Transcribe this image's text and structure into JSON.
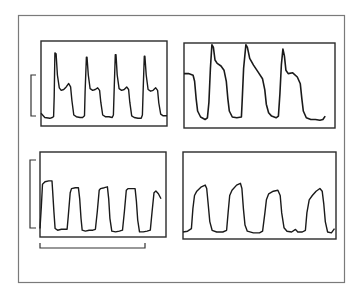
{
  "figure": {
    "colors": {
      "background": "#ffffff",
      "trace": "#1a1a1a",
      "frame": "#6e6e6e",
      "panel_border": "#2a2a2a",
      "scale_bar": "#333333"
    },
    "scale_bars": [
      {
        "id": "amplitude-top-left",
        "orientation": "vertical",
        "attached_to": "panel-1",
        "span_fraction": 0.49
      },
      {
        "id": "amplitude-bottom-left",
        "orientation": "vertical",
        "attached_to": "panel-3",
        "span_fraction": 0.8
      },
      {
        "id": "time-bottom-left",
        "orientation": "horizontal",
        "attached_to": "panel-3",
        "span_fraction": 0.83
      }
    ],
    "panels": [
      {
        "id": "panel-1",
        "position": "top-left",
        "waveform": "sharp-spike-with-secondary-hump",
        "cycles": 4,
        "points": [
          [
            0.0,
            0.15
          ],
          [
            0.03,
            0.1
          ],
          [
            0.07,
            0.09
          ],
          [
            0.09,
            0.1
          ],
          [
            0.1,
            0.11
          ],
          [
            0.105,
            0.35
          ],
          [
            0.11,
            0.86
          ],
          [
            0.12,
            0.85
          ],
          [
            0.13,
            0.6
          ],
          [
            0.145,
            0.45
          ],
          [
            0.16,
            0.42
          ],
          [
            0.18,
            0.43
          ],
          [
            0.2,
            0.46
          ],
          [
            0.22,
            0.5
          ],
          [
            0.235,
            0.46
          ],
          [
            0.245,
            0.3
          ],
          [
            0.26,
            0.13
          ],
          [
            0.28,
            0.11
          ],
          [
            0.31,
            0.1
          ],
          [
            0.33,
            0.1
          ],
          [
            0.345,
            0.12
          ],
          [
            0.35,
            0.4
          ],
          [
            0.36,
            0.81
          ],
          [
            0.365,
            0.81
          ],
          [
            0.375,
            0.6
          ],
          [
            0.39,
            0.44
          ],
          [
            0.41,
            0.42
          ],
          [
            0.43,
            0.43
          ],
          [
            0.45,
            0.45
          ],
          [
            0.465,
            0.42
          ],
          [
            0.475,
            0.28
          ],
          [
            0.49,
            0.13
          ],
          [
            0.51,
            0.11
          ],
          [
            0.54,
            0.11
          ],
          [
            0.565,
            0.1
          ],
          [
            0.575,
            0.13
          ],
          [
            0.58,
            0.4
          ],
          [
            0.59,
            0.84
          ],
          [
            0.595,
            0.84
          ],
          [
            0.605,
            0.6
          ],
          [
            0.62,
            0.44
          ],
          [
            0.64,
            0.42
          ],
          [
            0.66,
            0.43
          ],
          [
            0.68,
            0.46
          ],
          [
            0.695,
            0.43
          ],
          [
            0.705,
            0.28
          ],
          [
            0.72,
            0.12
          ],
          [
            0.74,
            0.1
          ],
          [
            0.77,
            0.09
          ],
          [
            0.795,
            0.09
          ],
          [
            0.805,
            0.13
          ],
          [
            0.81,
            0.4
          ],
          [
            0.82,
            0.82
          ],
          [
            0.825,
            0.82
          ],
          [
            0.835,
            0.6
          ],
          [
            0.85,
            0.43
          ],
          [
            0.87,
            0.41
          ],
          [
            0.89,
            0.42
          ],
          [
            0.91,
            0.45
          ],
          [
            0.925,
            0.42
          ],
          [
            0.935,
            0.27
          ],
          [
            0.95,
            0.14
          ],
          [
            0.97,
            0.12
          ],
          [
            1.0,
            0.12
          ]
        ]
      },
      {
        "id": "panel-2",
        "position": "top-right",
        "waveform": "tall-peak-with-slow-decay",
        "cycles": 3.5,
        "points": [
          [
            0.0,
            0.64
          ],
          [
            0.03,
            0.64
          ],
          [
            0.06,
            0.62
          ],
          [
            0.07,
            0.55
          ],
          [
            0.08,
            0.35
          ],
          [
            0.09,
            0.2
          ],
          [
            0.11,
            0.13
          ],
          [
            0.14,
            0.1
          ],
          [
            0.155,
            0.12
          ],
          [
            0.165,
            0.3
          ],
          [
            0.175,
            0.7
          ],
          [
            0.185,
            0.98
          ],
          [
            0.195,
            0.95
          ],
          [
            0.205,
            0.8
          ],
          [
            0.22,
            0.76
          ],
          [
            0.245,
            0.73
          ],
          [
            0.265,
            0.68
          ],
          [
            0.28,
            0.55
          ],
          [
            0.29,
            0.35
          ],
          [
            0.3,
            0.2
          ],
          [
            0.32,
            0.13
          ],
          [
            0.35,
            0.12
          ],
          [
            0.38,
            0.13
          ],
          [
            0.385,
            0.3
          ],
          [
            0.395,
            0.7
          ],
          [
            0.41,
            0.98
          ],
          [
            0.42,
            0.95
          ],
          [
            0.435,
            0.82
          ],
          [
            0.46,
            0.74
          ],
          [
            0.49,
            0.66
          ],
          [
            0.52,
            0.58
          ],
          [
            0.535,
            0.45
          ],
          [
            0.545,
            0.28
          ],
          [
            0.56,
            0.18
          ],
          [
            0.58,
            0.14
          ],
          [
            0.61,
            0.12
          ],
          [
            0.625,
            0.14
          ],
          [
            0.635,
            0.4
          ],
          [
            0.645,
            0.75
          ],
          [
            0.655,
            0.93
          ],
          [
            0.665,
            0.85
          ],
          [
            0.675,
            0.68
          ],
          [
            0.69,
            0.64
          ],
          [
            0.72,
            0.65
          ],
          [
            0.75,
            0.6
          ],
          [
            0.77,
            0.52
          ],
          [
            0.78,
            0.35
          ],
          [
            0.79,
            0.2
          ],
          [
            0.81,
            0.12
          ],
          [
            0.84,
            0.1
          ],
          [
            0.87,
            0.1
          ],
          [
            0.9,
            0.09
          ],
          [
            0.92,
            0.1
          ],
          [
            0.935,
            0.14
          ]
        ]
      },
      {
        "id": "panel-3",
        "position": "bottom-left",
        "waveform": "square-plateau",
        "cycles": 4.5,
        "points": [
          [
            0.0,
            0.1
          ],
          [
            0.01,
            0.35
          ],
          [
            0.02,
            0.62
          ],
          [
            0.04,
            0.65
          ],
          [
            0.07,
            0.66
          ],
          [
            0.095,
            0.66
          ],
          [
            0.1,
            0.55
          ],
          [
            0.11,
            0.3
          ],
          [
            0.12,
            0.1
          ],
          [
            0.14,
            0.08
          ],
          [
            0.17,
            0.09
          ],
          [
            0.2,
            0.09
          ],
          [
            0.215,
            0.09
          ],
          [
            0.225,
            0.25
          ],
          [
            0.24,
            0.52
          ],
          [
            0.25,
            0.57
          ],
          [
            0.28,
            0.58
          ],
          [
            0.305,
            0.58
          ],
          [
            0.315,
            0.45
          ],
          [
            0.325,
            0.22
          ],
          [
            0.335,
            0.08
          ],
          [
            0.36,
            0.07
          ],
          [
            0.39,
            0.08
          ],
          [
            0.42,
            0.08
          ],
          [
            0.44,
            0.09
          ],
          [
            0.455,
            0.3
          ],
          [
            0.47,
            0.55
          ],
          [
            0.48,
            0.57
          ],
          [
            0.51,
            0.58
          ],
          [
            0.535,
            0.59
          ],
          [
            0.545,
            0.45
          ],
          [
            0.555,
            0.22
          ],
          [
            0.57,
            0.07
          ],
          [
            0.6,
            0.06
          ],
          [
            0.63,
            0.07
          ],
          [
            0.655,
            0.08
          ],
          [
            0.67,
            0.3
          ],
          [
            0.685,
            0.55
          ],
          [
            0.7,
            0.57
          ],
          [
            0.73,
            0.57
          ],
          [
            0.755,
            0.57
          ],
          [
            0.765,
            0.42
          ],
          [
            0.775,
            0.2
          ],
          [
            0.79,
            0.06
          ],
          [
            0.82,
            0.06
          ],
          [
            0.85,
            0.07
          ],
          [
            0.875,
            0.08
          ],
          [
            0.89,
            0.3
          ],
          [
            0.905,
            0.52
          ],
          [
            0.92,
            0.54
          ],
          [
            0.94,
            0.51
          ],
          [
            0.96,
            0.45
          ]
        ]
      },
      {
        "id": "panel-4",
        "position": "bottom-right",
        "waveform": "rounded-plateau",
        "cycles": 4,
        "points": [
          [
            0.0,
            0.08
          ],
          [
            0.03,
            0.09
          ],
          [
            0.055,
            0.12
          ],
          [
            0.065,
            0.35
          ],
          [
            0.075,
            0.5
          ],
          [
            0.09,
            0.55
          ],
          [
            0.12,
            0.6
          ],
          [
            0.145,
            0.62
          ],
          [
            0.155,
            0.58
          ],
          [
            0.165,
            0.4
          ],
          [
            0.175,
            0.2
          ],
          [
            0.19,
            0.1
          ],
          [
            0.22,
            0.08
          ],
          [
            0.26,
            0.08
          ],
          [
            0.285,
            0.1
          ],
          [
            0.295,
            0.3
          ],
          [
            0.305,
            0.5
          ],
          [
            0.32,
            0.56
          ],
          [
            0.35,
            0.62
          ],
          [
            0.375,
            0.64
          ],
          [
            0.385,
            0.58
          ],
          [
            0.395,
            0.35
          ],
          [
            0.405,
            0.16
          ],
          [
            0.42,
            0.09
          ],
          [
            0.46,
            0.07
          ],
          [
            0.5,
            0.07
          ],
          [
            0.52,
            0.09
          ],
          [
            0.535,
            0.3
          ],
          [
            0.545,
            0.45
          ],
          [
            0.56,
            0.52
          ],
          [
            0.59,
            0.55
          ],
          [
            0.62,
            0.56
          ],
          [
            0.635,
            0.5
          ],
          [
            0.645,
            0.3
          ],
          [
            0.66,
            0.13
          ],
          [
            0.68,
            0.09
          ],
          [
            0.71,
            0.08
          ],
          [
            0.735,
            0.11
          ],
          [
            0.75,
            0.08
          ],
          [
            0.78,
            0.08
          ],
          [
            0.8,
            0.1
          ],
          [
            0.81,
            0.3
          ],
          [
            0.825,
            0.45
          ],
          [
            0.845,
            0.5
          ],
          [
            0.87,
            0.55
          ],
          [
            0.895,
            0.58
          ],
          [
            0.91,
            0.55
          ],
          [
            0.92,
            0.4
          ],
          [
            0.93,
            0.2
          ],
          [
            0.945,
            0.08
          ],
          [
            0.97,
            0.07
          ],
          [
            0.99,
            0.12
          ]
        ]
      }
    ]
  }
}
